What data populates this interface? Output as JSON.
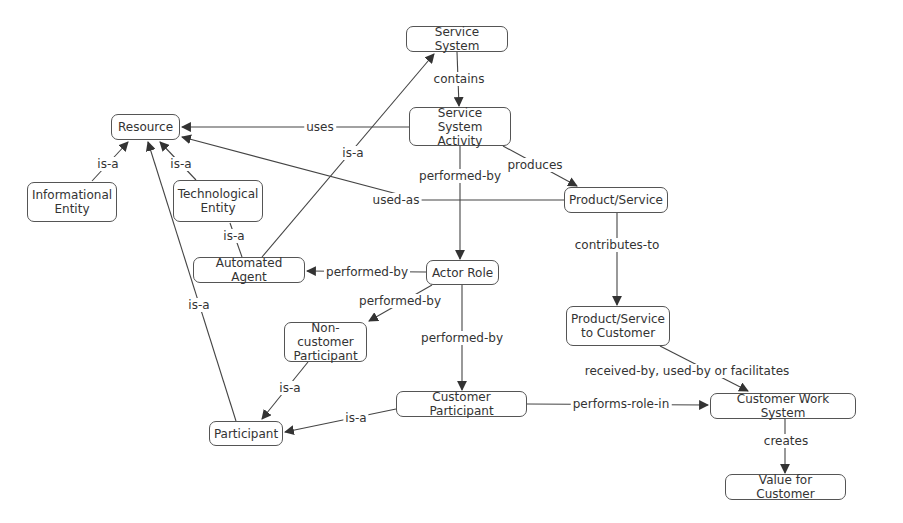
{
  "diagram": {
    "type": "concept-map",
    "nodes": {
      "service_system": "Service System",
      "service_system_activity": "Service System\nActivity",
      "resource": "Resource",
      "informational_entity": "Informational\nEntity",
      "technological_entity": "Technological\nEntity",
      "automated_agent": "Automated Agent",
      "actor_role": "Actor Role",
      "product_service": "Product/Service",
      "product_service_to_customer": "Product/Service\nto Customer",
      "non_customer_participant": "Non-customer\nParticipant",
      "participant": "Participant",
      "customer_participant": "Customer Participant",
      "customer_work_system": "Customer Work System",
      "value_for_customer": "Value for Customer"
    },
    "edges": {
      "contains": "contains",
      "uses": "uses",
      "isa_automated_service_system": "is-a",
      "produces": "produces",
      "performed_by_activity_actor": "performed-by",
      "used_as": "used-as",
      "isa_informational": "is-a",
      "isa_technological": "is-a",
      "isa_automated_technological": "is-a",
      "performed_by_actor_automated": "performed-by",
      "contributes_to": "contributes-to",
      "performed_by_actor_noncustomer": "performed-by",
      "performed_by_actor_customer": "performed-by",
      "isa_participant_resource": "is-a",
      "isa_noncustomer_participant": "is-a",
      "received_by": "received-by, used-by or facilitates",
      "isa_customer_participant": "is-a",
      "performs_role_in": "performs-role-in",
      "creates": "creates"
    },
    "colors": {
      "line": "#444444",
      "border": "#555555",
      "text": "#333333",
      "background": "#ffffff"
    }
  }
}
